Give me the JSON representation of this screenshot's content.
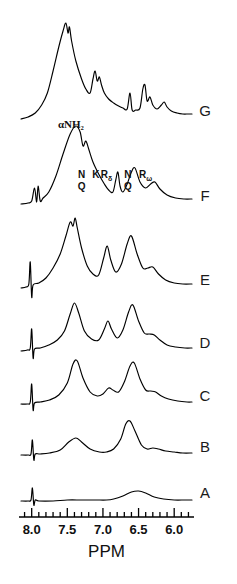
{
  "figure": {
    "kind": "nmr-spectra-stack",
    "axis_title": "PPM",
    "alpha_nh2_label": "αNH₂",
    "ink_color": "#000000",
    "background_color": "#ffffff"
  },
  "axis": {
    "label": "PPM",
    "direction": "decreasing-left-to-right",
    "tick_labels": [
      "8.0",
      "7.5",
      "7.0",
      "6.5",
      "6.0"
    ],
    "tick_values": [
      8.0,
      7.5,
      7.0,
      6.5,
      6.0
    ],
    "minor_tick_step": 0.1,
    "range": [
      8.15,
      5.75
    ]
  },
  "traces": [
    {
      "id": "G",
      "label": "G",
      "baseline_y": 119
    },
    {
      "id": "F",
      "label": "F",
      "baseline_y": 204
    },
    {
      "id": "E",
      "label": "E",
      "baseline_y": 288
    },
    {
      "id": "D",
      "label": "D",
      "baseline_y": 351
    },
    {
      "id": "C",
      "label": "C",
      "baseline_y": 404
    },
    {
      "id": "B",
      "label": "B",
      "baseline_y": 455
    },
    {
      "id": "A",
      "label": "A",
      "baseline_y": 501
    }
  ],
  "peak_annotations": [
    {
      "trace": "G",
      "text": "αNH₂",
      "ppm": 7.45,
      "kind": "alpha-amino"
    },
    {
      "trace": "F",
      "text": "N",
      "ppm": 7.3,
      "stack": 0
    },
    {
      "trace": "F",
      "text": "Q",
      "ppm": 7.3,
      "stack": 1
    },
    {
      "trace": "F",
      "text": "K",
      "ppm": 7.1,
      "stack": 0
    },
    {
      "trace": "F",
      "text": "R",
      "subscript": "δ",
      "ppm": 6.95,
      "stack": 0
    },
    {
      "trace": "F",
      "text": "N",
      "ppm": 6.65,
      "stack": 0
    },
    {
      "trace": "F",
      "text": "Q",
      "ppm": 6.65,
      "stack": 1
    },
    {
      "trace": "F",
      "text": "R",
      "subscript": "ω",
      "ppm": 6.4,
      "stack": 0
    }
  ],
  "chart_data": {
    "type": "line",
    "title": "",
    "xlabel": "PPM",
    "ylabel": "",
    "xlim": [
      8.15,
      5.75
    ],
    "x_reversed": true,
    "grid": false,
    "legend": "right-of-trace",
    "tick_labels": [
      "8.0",
      "7.5",
      "7.0",
      "6.5",
      "6.0"
    ],
    "series": [
      {
        "name": "A",
        "points": [
          [
            8.15,
            0
          ],
          [
            8.05,
            0
          ],
          [
            8.01,
            1
          ],
          [
            7.99,
            13
          ],
          [
            7.97,
            -4
          ],
          [
            7.95,
            1
          ],
          [
            7.9,
            0
          ],
          [
            7.7,
            0
          ],
          [
            7.5,
            1
          ],
          [
            7.3,
            1
          ],
          [
            7.1,
            1
          ],
          [
            6.95,
            1
          ],
          [
            6.85,
            2
          ],
          [
            6.72,
            5
          ],
          [
            6.6,
            9
          ],
          [
            6.5,
            10
          ],
          [
            6.4,
            8
          ],
          [
            6.28,
            4
          ],
          [
            6.15,
            2
          ],
          [
            6.0,
            1
          ],
          [
            5.85,
            1
          ],
          [
            5.75,
            1
          ]
        ]
      },
      {
        "name": "B",
        "points": [
          [
            8.15,
            0
          ],
          [
            8.05,
            0
          ],
          [
            8.01,
            1
          ],
          [
            7.99,
            15
          ],
          [
            7.97,
            -5
          ],
          [
            7.95,
            1
          ],
          [
            7.88,
            1
          ],
          [
            7.75,
            2
          ],
          [
            7.6,
            5
          ],
          [
            7.48,
            13
          ],
          [
            7.38,
            17
          ],
          [
            7.3,
            13
          ],
          [
            7.18,
            6
          ],
          [
            7.05,
            3
          ],
          [
            6.95,
            3
          ],
          [
            6.85,
            6
          ],
          [
            6.75,
            16
          ],
          [
            6.68,
            31
          ],
          [
            6.62,
            34
          ],
          [
            6.55,
            24
          ],
          [
            6.46,
            10
          ],
          [
            6.38,
            6
          ],
          [
            6.3,
            7
          ],
          [
            6.22,
            6
          ],
          [
            6.12,
            4
          ],
          [
            6.0,
            3
          ],
          [
            5.88,
            2
          ],
          [
            5.75,
            2
          ]
        ]
      },
      {
        "name": "C",
        "points": [
          [
            8.15,
            0
          ],
          [
            8.06,
            0
          ],
          [
            8.02,
            2
          ],
          [
            8.0,
            20
          ],
          [
            7.98,
            -6
          ],
          [
            7.96,
            1
          ],
          [
            7.88,
            2
          ],
          [
            7.75,
            4
          ],
          [
            7.62,
            9
          ],
          [
            7.5,
            21
          ],
          [
            7.42,
            40
          ],
          [
            7.36,
            43
          ],
          [
            7.28,
            26
          ],
          [
            7.18,
            12
          ],
          [
            7.08,
            8
          ],
          [
            7.0,
            10
          ],
          [
            6.92,
            16
          ],
          [
            6.86,
            14
          ],
          [
            6.78,
            12
          ],
          [
            6.7,
            22
          ],
          [
            6.62,
            38
          ],
          [
            6.56,
            41
          ],
          [
            6.48,
            25
          ],
          [
            6.4,
            14
          ],
          [
            6.33,
            13
          ],
          [
            6.26,
            12
          ],
          [
            6.18,
            8
          ],
          [
            6.08,
            5
          ],
          [
            5.95,
            3
          ],
          [
            5.82,
            2
          ],
          [
            5.75,
            2
          ]
        ]
      },
      {
        "name": "D",
        "points": [
          [
            8.15,
            0
          ],
          [
            8.06,
            1
          ],
          [
            8.02,
            3
          ],
          [
            8.0,
            22
          ],
          [
            7.98,
            -7
          ],
          [
            7.96,
            2
          ],
          [
            7.88,
            3
          ],
          [
            7.76,
            6
          ],
          [
            7.64,
            11
          ],
          [
            7.54,
            20
          ],
          [
            7.46,
            37
          ],
          [
            7.4,
            48
          ],
          [
            7.34,
            38
          ],
          [
            7.26,
            20
          ],
          [
            7.16,
            12
          ],
          [
            7.06,
            11
          ],
          [
            6.98,
            22
          ],
          [
            6.93,
            30
          ],
          [
            6.88,
            22
          ],
          [
            6.8,
            13
          ],
          [
            6.72,
            21
          ],
          [
            6.64,
            39
          ],
          [
            6.58,
            46
          ],
          [
            6.5,
            30
          ],
          [
            6.42,
            18
          ],
          [
            6.35,
            17
          ],
          [
            6.28,
            16
          ],
          [
            6.2,
            11
          ],
          [
            6.1,
            6
          ],
          [
            5.98,
            4
          ],
          [
            5.85,
            3
          ],
          [
            5.75,
            3
          ]
        ]
      },
      {
        "name": "E",
        "points": [
          [
            8.15,
            0
          ],
          [
            8.08,
            1
          ],
          [
            8.04,
            4
          ],
          [
            8.02,
            26
          ],
          [
            8.0,
            -9
          ],
          [
            7.98,
            3
          ],
          [
            7.9,
            5
          ],
          [
            7.8,
            10
          ],
          [
            7.7,
            20
          ],
          [
            7.6,
            34
          ],
          [
            7.52,
            52
          ],
          [
            7.46,
            66
          ],
          [
            7.42,
            62
          ],
          [
            7.39,
            70
          ],
          [
            7.36,
            60
          ],
          [
            7.3,
            40
          ],
          [
            7.22,
            22
          ],
          [
            7.14,
            14
          ],
          [
            7.06,
            13
          ],
          [
            6.99,
            30
          ],
          [
            6.94,
            42
          ],
          [
            6.89,
            28
          ],
          [
            6.82,
            16
          ],
          [
            6.74,
            24
          ],
          [
            6.66,
            44
          ],
          [
            6.6,
            52
          ],
          [
            6.52,
            34
          ],
          [
            6.44,
            20
          ],
          [
            6.37,
            20
          ],
          [
            6.3,
            21
          ],
          [
            6.22,
            14
          ],
          [
            6.12,
            8
          ],
          [
            6.0,
            5
          ],
          [
            5.88,
            4
          ],
          [
            5.75,
            4
          ]
        ]
      },
      {
        "name": "F",
        "points": [
          [
            8.15,
            0
          ],
          [
            8.05,
            1
          ],
          [
            8.0,
            3
          ],
          [
            7.96,
            16
          ],
          [
            7.93,
            2
          ],
          [
            7.91,
            18
          ],
          [
            7.88,
            3
          ],
          [
            7.84,
            6
          ],
          [
            7.76,
            12
          ],
          [
            7.66,
            28
          ],
          [
            7.56,
            50
          ],
          [
            7.46,
            70
          ],
          [
            7.38,
            78
          ],
          [
            7.32,
            72
          ],
          [
            7.28,
            58
          ],
          [
            7.24,
            63
          ],
          [
            7.2,
            55
          ],
          [
            7.14,
            42
          ],
          [
            7.06,
            30
          ],
          [
            6.98,
            20
          ],
          [
            6.92,
            14
          ],
          [
            6.86,
            12
          ],
          [
            6.82,
            24
          ],
          [
            6.79,
            32
          ],
          [
            6.76,
            18
          ],
          [
            6.72,
            12
          ],
          [
            6.66,
            20
          ],
          [
            6.6,
            32
          ],
          [
            6.55,
            36
          ],
          [
            6.48,
            22
          ],
          [
            6.4,
            16
          ],
          [
            6.33,
            20
          ],
          [
            6.27,
            22
          ],
          [
            6.2,
            15
          ],
          [
            6.1,
            9
          ],
          [
            5.98,
            6
          ],
          [
            5.86,
            5
          ],
          [
            5.75,
            5
          ]
        ]
      },
      {
        "name": "G",
        "points": [
          [
            8.15,
            0
          ],
          [
            8.05,
            2
          ],
          [
            7.95,
            6
          ],
          [
            7.86,
            14
          ],
          [
            7.78,
            26
          ],
          [
            7.7,
            48
          ],
          [
            7.62,
            72
          ],
          [
            7.56,
            88
          ],
          [
            7.52,
            96
          ],
          [
            7.49,
            86
          ],
          [
            7.47,
            92
          ],
          [
            7.44,
            78
          ],
          [
            7.38,
            58
          ],
          [
            7.3,
            40
          ],
          [
            7.24,
            30
          ],
          [
            7.18,
            26
          ],
          [
            7.14,
            40
          ],
          [
            7.11,
            48
          ],
          [
            7.08,
            38
          ],
          [
            7.05,
            42
          ],
          [
            7.02,
            34
          ],
          [
            6.98,
            26
          ],
          [
            6.92,
            20
          ],
          [
            6.85,
            16
          ],
          [
            6.78,
            13
          ],
          [
            6.72,
            11
          ],
          [
            6.66,
            10
          ],
          [
            6.62,
            26
          ],
          [
            6.59,
            9
          ],
          [
            6.54,
            9
          ],
          [
            6.48,
            11
          ],
          [
            6.44,
            30
          ],
          [
            6.41,
            34
          ],
          [
            6.38,
            18
          ],
          [
            6.34,
            22
          ],
          [
            6.3,
            14
          ],
          [
            6.24,
            10
          ],
          [
            6.18,
            14
          ],
          [
            6.14,
            17
          ],
          [
            6.1,
            12
          ],
          [
            6.04,
            8
          ],
          [
            5.96,
            6
          ],
          [
            5.88,
            5
          ],
          [
            5.8,
            5
          ],
          [
            5.75,
            5
          ]
        ]
      }
    ]
  }
}
